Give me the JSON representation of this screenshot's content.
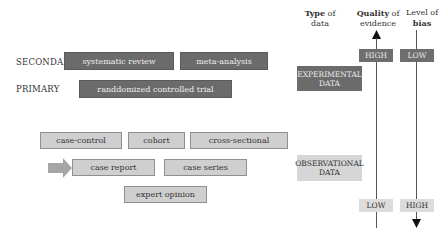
{
  "levels": {
    "secondary": "SECONDARY",
    "primary": "PRIMARY"
  },
  "studies": {
    "systematic_review": "systematic review",
    "meta_analysis": "meta-analysis",
    "rct": "randdomized controlled trial",
    "case_control": "case-control",
    "cohort": "cohort",
    "cross_sectional": "cross-sectional",
    "case_report": "case report",
    "case_series": "case series",
    "expert_opinion": "expert opinion"
  },
  "headers": {
    "type_bold": "Type",
    "type_rest": " of",
    "type_line2": "data",
    "quality_bold": "Quality",
    "quality_rest": " of",
    "quality_line2": "evidence",
    "bias_line1": "Level of",
    "bias_bold": "bias"
  },
  "data_types": {
    "experimental_line1": "EXPERIMENTAL",
    "experimental_line2": "DATA",
    "observational_line1": "OBSERVATIONAL",
    "observational_line2": "DATA"
  },
  "scales": {
    "quality_top": "HIGH",
    "quality_bottom": "LOW",
    "bias_top": "LOW",
    "bias_bottom": "HIGH"
  },
  "colors": {
    "dark_box": "#6b6b6b",
    "light_box": "#cfcfcf",
    "arrow": "#a6a6a6"
  }
}
